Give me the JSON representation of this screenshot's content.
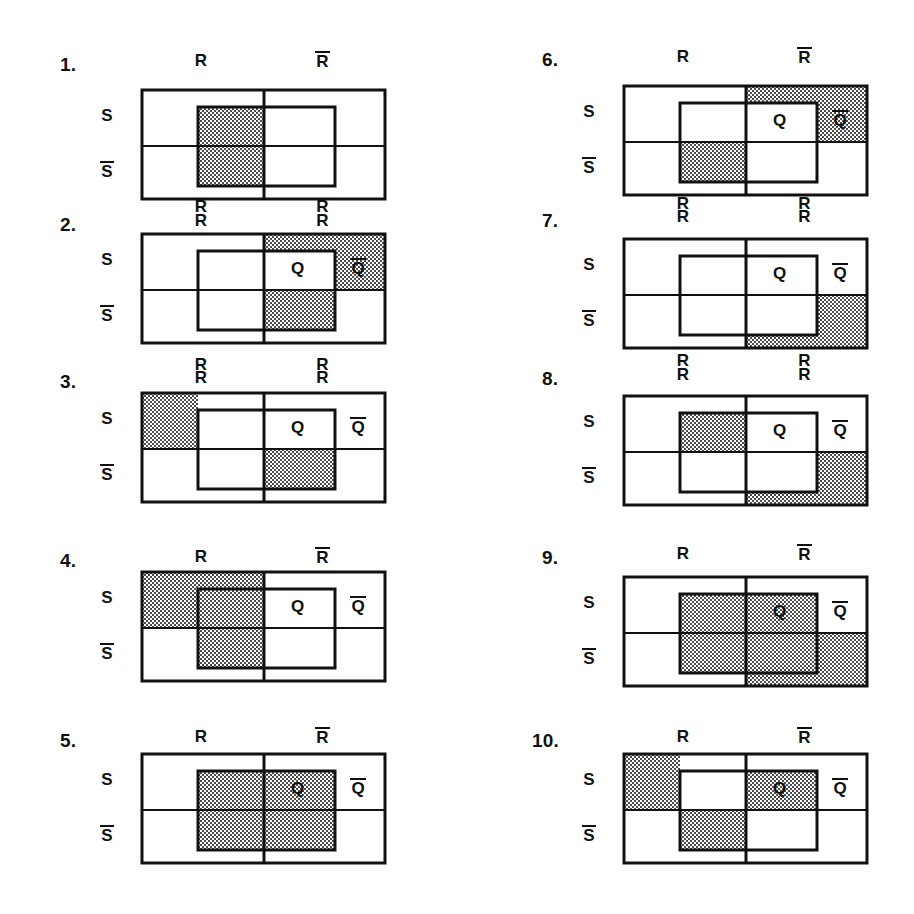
{
  "page": {
    "width": 914,
    "height": 914,
    "background": "#ffffff",
    "ink": "#111111",
    "shade_color": "#9a9a9a",
    "shade_pattern": "checkerboard-dither-50"
  },
  "labels": {
    "R": "R",
    "R_bar": "R",
    "S": "S",
    "S_bar": "S",
    "Q": "Q",
    "Q_bar": "Q"
  },
  "chart_data": {
    "type": "diagram",
    "subtype": "venn-karnaugh-grid",
    "axes": {
      "columns": [
        "R",
        "R-bar"
      ],
      "rows": [
        "S",
        "S-bar"
      ]
    },
    "geometry": {
      "outer_width": 243,
      "outer_height": 109,
      "outer_mid_x": 122,
      "outer_mid_y": 56,
      "inner_left": 56,
      "inner_right": 193,
      "inner_top": 17,
      "inner_bottom": 96
    },
    "regions_key": [
      "outer-top-left",
      "outer-top-right",
      "outer-bottom-left",
      "outer-bottom-right",
      "inner-top-left",
      "inner-top-right",
      "inner-bottom-left",
      "inner-bottom-right"
    ],
    "panels": [
      {
        "index": "1.",
        "top_heads": [
          "R",
          "R_bar"
        ],
        "bottom_heads": [],
        "row_heads": [
          "S",
          "S_bar"
        ],
        "q_labels": [],
        "shaded": [
          "inner-top-left",
          "inner-bottom-left"
        ]
      },
      {
        "index": "2.",
        "top_heads": [
          "R",
          "R_bar"
        ],
        "bottom_heads": [],
        "row_heads": [
          "S",
          "S_bar"
        ],
        "q_labels": [
          "Q",
          "Q_bar"
        ],
        "shaded": [
          "outer-top-right-outside-inner",
          "inner-top-right-far",
          "inner-bottom-right"
        ]
      },
      {
        "index": "3.",
        "top_heads": [
          "R",
          "R_bar"
        ],
        "bottom_heads": [],
        "row_heads": [
          "S",
          "S_bar"
        ],
        "q_labels": [
          "Q",
          "Q_bar"
        ],
        "shaded": [
          "outer-top-left-outside-inner",
          "inner-bottom-right"
        ]
      },
      {
        "index": "4.",
        "top_heads": [
          "R",
          "R_bar"
        ],
        "bottom_heads": [],
        "row_heads": [
          "S",
          "S_bar"
        ],
        "q_labels": [
          "Q",
          "Q_bar"
        ],
        "shaded": [
          "outer-top-left",
          "inner-top-left",
          "inner-bottom-left"
        ]
      },
      {
        "index": "5.",
        "top_heads": [
          "R",
          "R_bar"
        ],
        "bottom_heads": [],
        "row_heads": [
          "S",
          "S_bar"
        ],
        "q_labels": [
          "Q",
          "Q_bar"
        ],
        "shaded": [
          "inner-top-left",
          "inner-top-right",
          "inner-bottom-left",
          "inner-bottom-right"
        ]
      },
      {
        "index": "6.",
        "top_heads": [
          "R",
          "R_bar"
        ],
        "bottom_heads": [],
        "row_heads": [
          "S",
          "S_bar"
        ],
        "q_labels": [
          "Q",
          "Q_bar"
        ],
        "shaded": [
          "outer-top-right-outside-inner",
          "inner-top-right-far",
          "inner-bottom-left"
        ]
      },
      {
        "index": "7.",
        "top_heads": [
          "R",
          "R_bar"
        ],
        "bottom_heads": [],
        "row_heads": [
          "S",
          "S_bar"
        ],
        "q_labels": [
          "Q",
          "Q_bar"
        ],
        "shaded": [
          "outer-bottom-right-outside-inner"
        ]
      },
      {
        "index": "8.",
        "top_heads": [
          "R",
          "R_bar"
        ],
        "bottom_heads": [],
        "row_heads": [
          "S",
          "S_bar"
        ],
        "q_labels": [
          "Q",
          "Q_bar"
        ],
        "shaded": [
          "inner-top-left",
          "outer-bottom-right-outside-inner"
        ]
      },
      {
        "index": "9.",
        "top_heads": [
          "R",
          "R_bar"
        ],
        "bottom_heads": [],
        "row_heads": [
          "S",
          "S_bar"
        ],
        "q_labels": [
          "Q",
          "Q_bar"
        ],
        "shaded": [
          "inner-all",
          "outer-bottom-right-outside-inner"
        ]
      },
      {
        "index": "10.",
        "top_heads": [
          "R",
          "R_bar"
        ],
        "bottom_heads": [],
        "row_heads": [
          "S",
          "S_bar"
        ],
        "q_labels": [
          "Q",
          "Q_bar"
        ],
        "shaded": [
          "outer-top-left-outside-inner",
          "inner-top-right",
          "inner-bottom-left"
        ]
      }
    ],
    "shared_bottom_heads": [
      {
        "after_panel": "1.",
        "labels": [
          "R",
          "R"
        ]
      },
      {
        "after_panel": "2.",
        "labels": [
          "R",
          "R"
        ]
      },
      {
        "after_panel": "6.",
        "labels": [
          "R",
          "R"
        ]
      },
      {
        "after_panel": "7.",
        "labels": [
          "R",
          "R"
        ]
      }
    ]
  }
}
